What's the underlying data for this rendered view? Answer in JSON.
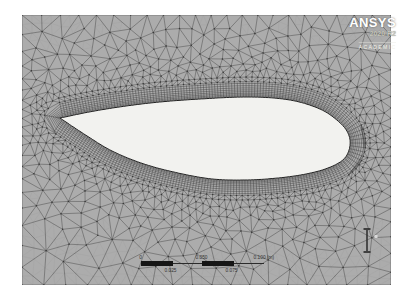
{
  "logo": {
    "brand": "ANSYS",
    "release": "2020 R2",
    "license": "ACADEMIC"
  },
  "scale_bar": {
    "tick_labels_top": [
      "0",
      "0.050",
      "0.100 (m)"
    ],
    "tick_labels_bottom": [
      "0.025",
      "0.075"
    ]
  },
  "colors": {
    "page_bg": "#ffffff",
    "viewport_bg": "#acacac",
    "mesh_line": "#4f4f4f",
    "mesh_subline": "#9a9a9a",
    "mesh_node": "#383838",
    "inflation_line": "#2e2e2e",
    "airfoil_fill": "#f2f2ef",
    "airfoil_stroke": "#1f1f1f",
    "scale_bar_fill": "#161616",
    "label_color": "#333333"
  }
}
